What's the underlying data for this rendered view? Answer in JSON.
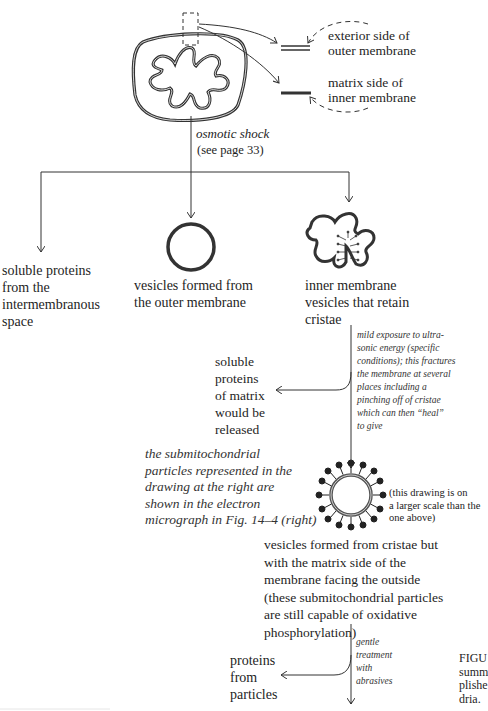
{
  "top_legend": {
    "exterior": "exterior side of\nouter membrane",
    "matrix": "matrix side of\ninner membrane"
  },
  "step1": {
    "label": "osmotic shock\n",
    "ref": "(see page 33)"
  },
  "products1": {
    "soluble_intermembrane": "soluble proteins\nfrom the\nintermembranous\nspace",
    "outer_vesicles": "vesicles formed from\nthe outer membrane",
    "inner_vesicles": "inner membrane\nvesicles that retain\ncristae"
  },
  "step2": {
    "label": "mild exposure to ultra-\nsonic energy (specific\nconditions); this fractures\nthe membrane at several\nplaces including a\npinching off of cristae\nwhich can then “heal”\nto give"
  },
  "matrix_release": "soluble\nproteins\nof matrix\nwould be\nreleased",
  "submito_note": "the submitochondrial\nparticles represented in the\ndrawing at the right are\nshown in the electron\nmicrograph in Fig. 14–4 (right)",
  "scale_note": "(this drawing is on\na larger scale than the\none above)",
  "submito_desc": "vesicles formed from cristae but\nwith the matrix side of the\nmembrane facing the outside\n(these submitochondrial particles\nare still capable of oxidative\nphosphorylation)",
  "step3": {
    "label": "gentle\ntreatment\nwith\nabrasives"
  },
  "particle_proteins": "proteins\nfrom\nparticles",
  "caption_fragment": "FIGU\nsumm\nplishe\ndria.",
  "colors": {
    "ink": "#333333",
    "text": "#1e1e1e",
    "background": "#ffffff"
  }
}
